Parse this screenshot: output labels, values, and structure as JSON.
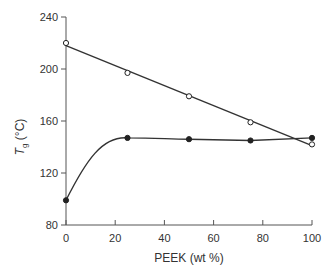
{
  "chart_data": {
    "type": "line",
    "title": "",
    "xlabel": "PEEK (wt %)",
    "ylabel": "T_g (°C)",
    "ylabel_main": "T",
    "ylabel_sub": "g",
    "ylabel_unit": " (°C)",
    "xlim": [
      0,
      100
    ],
    "ylim": [
      80,
      240
    ],
    "xticks": [
      0,
      20,
      40,
      60,
      80,
      100
    ],
    "yticks": [
      80,
      120,
      160,
      200,
      240
    ],
    "grid": false,
    "legend": null,
    "series": [
      {
        "name": "open circles (upper Tg)",
        "marker": "open-circle",
        "line": "linear-fit",
        "x": [
          0,
          25,
          50,
          75,
          100
        ],
        "y": [
          220,
          197,
          179,
          159,
          142
        ],
        "fit_line": {
          "x": [
            0,
            100
          ],
          "y": [
            218,
            141
          ]
        }
      },
      {
        "name": "filled circles (lower Tg)",
        "marker": "filled-circle",
        "line": "smooth-curve",
        "x": [
          0,
          25,
          50,
          75,
          100
        ],
        "y": [
          99,
          147,
          146,
          145,
          147
        ]
      }
    ],
    "colors": {
      "axis": "#555555",
      "line": "#333333",
      "marker": "#222222"
    }
  }
}
